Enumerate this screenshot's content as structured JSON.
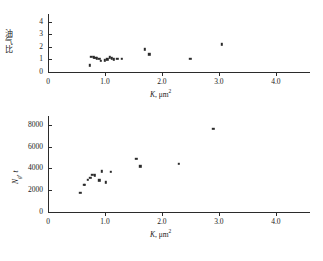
{
  "chart_data": [
    {
      "id": "top",
      "type": "scatter",
      "title": "",
      "xlabel": "K,  μm²",
      "xlabel_symbol": "K",
      "xlabel_unit": ",  μm",
      "xlabel_exp": "2",
      "ylabel": "油气比",
      "xlim": [
        0,
        4.6
      ],
      "ylim": [
        0,
        4.6
      ],
      "xticks": [
        0,
        1.0,
        2.0,
        3.0,
        4.0
      ],
      "xticklabels": [
        "0",
        "1.0",
        "2.0",
        "3.0",
        "4.0"
      ],
      "yticks": [
        0,
        1,
        2,
        3,
        4
      ],
      "yticklabels": [
        "0",
        "1",
        "2",
        "3",
        "4"
      ],
      "grid": false,
      "legend": false,
      "marker": "square",
      "points": [
        {
          "x": 0.73,
          "y": 0.52
        },
        {
          "x": 0.76,
          "y": 1.22
        },
        {
          "x": 0.8,
          "y": 1.18
        },
        {
          "x": 0.83,
          "y": 1.12
        },
        {
          "x": 0.86,
          "y": 1.1
        },
        {
          "x": 0.9,
          "y": 1.05
        },
        {
          "x": 0.93,
          "y": 0.88
        },
        {
          "x": 1.0,
          "y": 0.92
        },
        {
          "x": 1.04,
          "y": 1.0
        },
        {
          "x": 1.08,
          "y": 1.18
        },
        {
          "x": 1.12,
          "y": 1.08
        },
        {
          "x": 1.16,
          "y": 1.02
        },
        {
          "x": 1.22,
          "y": 1.05
        },
        {
          "x": 1.3,
          "y": 1.05
        },
        {
          "x": 1.7,
          "y": 1.8
        },
        {
          "x": 1.78,
          "y": 1.4
        },
        {
          "x": 2.5,
          "y": 1.05
        },
        {
          "x": 3.05,
          "y": 2.2
        }
      ]
    },
    {
      "id": "bottom",
      "type": "scatter",
      "title": "",
      "xlabel": "K,  μm²",
      "xlabel_symbol": "K",
      "xlabel_unit": ",  μm",
      "xlabel_exp": "2",
      "ylabel_symbol": "N",
      "ylabel_sub": "g",
      "ylabel_unit": ",  t",
      "xlim": [
        0,
        4.6
      ],
      "ylim": [
        0,
        8800
      ],
      "xticks": [
        0,
        1.0,
        2.0,
        3.0,
        4.0
      ],
      "xticklabels": [
        "0",
        "1.0",
        "2.0",
        "3.0",
        "4.0"
      ],
      "yticks": [
        0,
        2000,
        4000,
        6000,
        8000
      ],
      "yticklabels": [
        "0",
        "2000",
        "4000",
        "6000",
        "8000"
      ],
      "grid": false,
      "legend": false,
      "marker": "square",
      "points": [
        {
          "x": 0.57,
          "y": 1750
        },
        {
          "x": 0.63,
          "y": 2480
        },
        {
          "x": 0.65,
          "y": 2520
        },
        {
          "x": 0.7,
          "y": 2950
        },
        {
          "x": 0.74,
          "y": 3150
        },
        {
          "x": 0.78,
          "y": 3400
        },
        {
          "x": 0.82,
          "y": 3350
        },
        {
          "x": 0.9,
          "y": 2920
        },
        {
          "x": 0.94,
          "y": 3720
        },
        {
          "x": 1.02,
          "y": 2720
        },
        {
          "x": 1.1,
          "y": 3680
        },
        {
          "x": 1.55,
          "y": 4900
        },
        {
          "x": 1.62,
          "y": 4180
        },
        {
          "x": 2.3,
          "y": 4420
        },
        {
          "x": 2.9,
          "y": 7600
        }
      ]
    }
  ]
}
